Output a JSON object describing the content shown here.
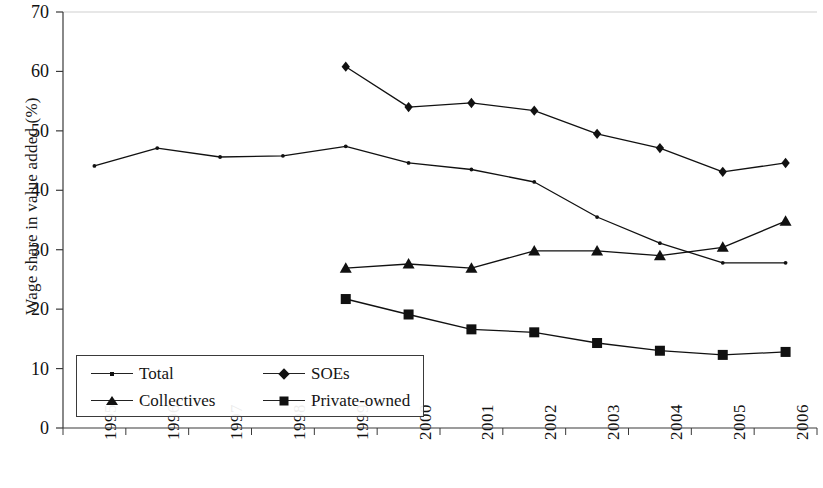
{
  "chart_data": {
    "type": "line",
    "title": "",
    "xlabel": "",
    "ylabel": "Wage share in value added (%)",
    "ylim": [
      0,
      70
    ],
    "ytick_labels": [
      "0",
      "10",
      "20",
      "30",
      "40",
      "50",
      "60",
      "70"
    ],
    "yticks": [
      0,
      10,
      20,
      30,
      40,
      50,
      60,
      70
    ],
    "grid": false,
    "legend_position": "lower-left-inside",
    "categories": [
      "1995",
      "1996",
      "1997",
      "1998",
      "1999",
      "2000",
      "2001",
      "2002",
      "2003",
      "2004",
      "2005",
      "2006"
    ],
    "series": [
      {
        "name": "Total",
        "marker": "dot",
        "color": "#111111",
        "values": [
          44.1,
          47.1,
          45.6,
          45.8,
          47.4,
          44.6,
          43.5,
          41.4,
          35.5,
          31.1,
          27.8,
          27.8
        ]
      },
      {
        "name": "SOEs",
        "marker": "diamond",
        "color": "#111111",
        "values": [
          null,
          null,
          null,
          null,
          60.8,
          54.0,
          54.7,
          53.4,
          49.5,
          47.1,
          43.1,
          44.6
        ]
      },
      {
        "name": "Collectives",
        "marker": "triangle",
        "color": "#111111",
        "values": [
          null,
          null,
          null,
          null,
          26.9,
          27.6,
          26.9,
          29.8,
          29.8,
          29.0,
          30.4,
          34.8
        ]
      },
      {
        "name": "Private-owned",
        "marker": "square",
        "color": "#111111",
        "values": [
          null,
          null,
          null,
          null,
          21.7,
          19.1,
          16.6,
          16.1,
          14.3,
          13.0,
          12.3,
          12.8
        ]
      }
    ]
  },
  "legend": {
    "entries": [
      {
        "label": "Total",
        "marker": "dot"
      },
      {
        "label": "SOEs",
        "marker": "diamond"
      },
      {
        "label": "Collectives",
        "marker": "triangle"
      },
      {
        "label": "Private-owned",
        "marker": "square"
      }
    ]
  },
  "axis_style": {
    "axis_color": "#3a3a3a",
    "line_color": "#222222",
    "top_rule_color": "#cfcfcf"
  }
}
